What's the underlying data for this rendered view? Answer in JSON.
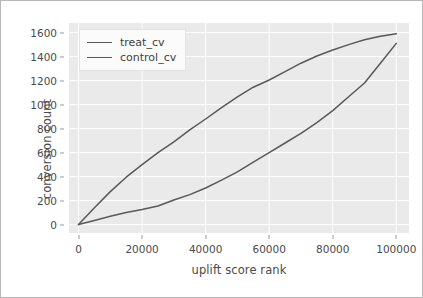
{
  "chart_data": {
    "type": "line",
    "title": "",
    "xlabel": "uplift score rank",
    "ylabel": "conversion count",
    "xlim": [
      -3000,
      104000
    ],
    "ylim": [
      -70,
      1680
    ],
    "grid": true,
    "legend_position": "upper left",
    "xticks": [
      0,
      20000,
      40000,
      60000,
      80000,
      100000
    ],
    "xticklabels": [
      "0",
      "20000",
      "40000",
      "60000",
      "80000",
      "100000"
    ],
    "yticks": [
      0,
      200,
      400,
      600,
      800,
      1000,
      1200,
      1400,
      1600
    ],
    "yticklabels": [
      "0",
      "200",
      "400",
      "600",
      "800",
      "1000",
      "1200",
      "1400",
      "1600"
    ],
    "line_color": "#595959",
    "plot_bgcolor": "#eaeaea",
    "grid_color": "#ffffff",
    "x": [
      0,
      5000,
      10000,
      15000,
      20000,
      25000,
      30000,
      35000,
      40000,
      45000,
      50000,
      55000,
      60000,
      65000,
      70000,
      75000,
      80000,
      85000,
      90000,
      95000,
      100000
    ],
    "series": [
      {
        "name": "treat_cv",
        "values": [
          0,
          140,
          275,
          395,
          500,
          600,
          690,
          790,
          880,
          975,
          1065,
          1145,
          1205,
          1275,
          1345,
          1405,
          1455,
          1500,
          1540,
          1570,
          1590
        ]
      },
      {
        "name": "control_cv",
        "values": [
          0,
          35,
          70,
          100,
          125,
          155,
          205,
          250,
          305,
          370,
          440,
          520,
          600,
          680,
          760,
          850,
          950,
          1065,
          1180,
          1345,
          1510
        ]
      }
    ]
  },
  "legend": {
    "entries": [
      {
        "label": "treat_cv"
      },
      {
        "label": "control_cv"
      }
    ]
  }
}
